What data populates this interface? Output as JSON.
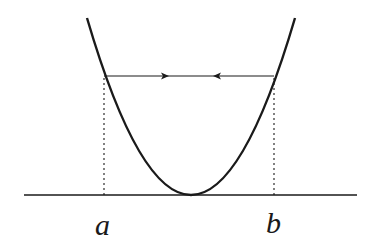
{
  "diagram": {
    "type": "parabola-with-horizontal-segment",
    "labels": {
      "a": "a",
      "b": "b"
    },
    "colors": {
      "stroke": "#1a1a1a",
      "background": "#ffffff"
    },
    "elements": {
      "baseline": "horizontal axis",
      "curve": "parabola touching baseline at vertex",
      "chord": "horizontal segment between curve points above a and b with arrows pointing inward",
      "dashed_lines": "vertical dotted projections from chord endpoints to a and b on axis"
    }
  }
}
